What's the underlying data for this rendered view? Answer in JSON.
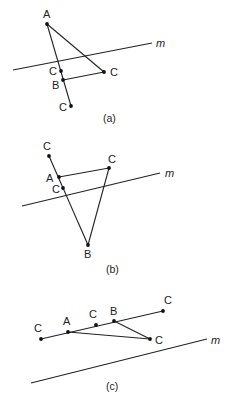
{
  "figures": [
    {
      "caption": "(a)",
      "line_label": "m",
      "labels": {
        "A": "A",
        "B": "B",
        "C1": "C",
        "C2": "C",
        "C3": "C"
      }
    },
    {
      "caption": "(b)",
      "line_label": "m",
      "labels": {
        "A": "A",
        "B": "B",
        "C1": "C",
        "C2": "C",
        "C3": "C"
      }
    },
    {
      "caption": "(c)",
      "line_label": "m",
      "labels": {
        "A": "A",
        "B": "B",
        "C1": "C",
        "C2": "C",
        "C3": "C",
        "C4": "C"
      }
    }
  ]
}
